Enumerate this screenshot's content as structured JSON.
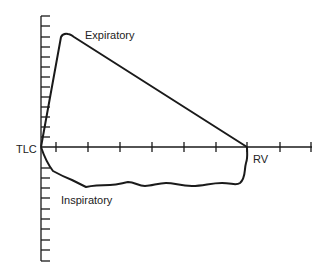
{
  "labels": {
    "expiratory": "Expiratory",
    "inspiratory": "Inspiratory",
    "tlc": "TLC",
    "rv": "RV"
  },
  "colors": {
    "line": "#1a1a1a",
    "text": "#222222",
    "background": "#ffffff"
  },
  "axes": {
    "x_axis": {
      "y": 147,
      "x_start": 41,
      "x_end": 312,
      "tick_count": 9
    },
    "y_axis": {
      "x": 41,
      "y_start": 16,
      "y_end": 261,
      "ticks_above": 13,
      "ticks_below": 10
    }
  }
}
